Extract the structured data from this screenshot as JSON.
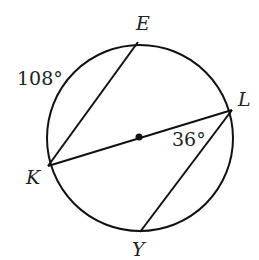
{
  "diagram": {
    "type": "circle-geometry",
    "points": {
      "E": "E",
      "L": "L",
      "K": "K",
      "Y": "Y"
    },
    "annotations": {
      "arc_KE": "108°",
      "angle_KLY": "36°"
    },
    "segments": [
      "KE",
      "KL",
      "LY"
    ],
    "center_marked": true,
    "colors": {
      "stroke": "#111111",
      "text": "#222222"
    }
  }
}
